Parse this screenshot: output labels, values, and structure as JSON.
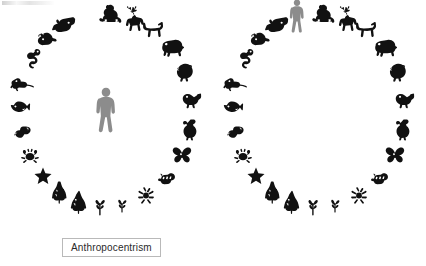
{
  "figure": {
    "background_color": "#ffffff",
    "silhouette_color": "#111111",
    "human_color": "#8c8c8c",
    "label_border_color": "#b9b9b9",
    "label_text_color": "#2a2a2a"
  },
  "panels": [
    {
      "id": "anthropocentrism",
      "label": "Anthropocentrism",
      "human_position": "center",
      "center_occupant": "human",
      "description": "Human figure stands alone at the centre of a ring of other organisms"
    },
    {
      "id": "ecocentrism",
      "label": "Ecocentrism",
      "human_position": "ring",
      "center_occupant": "none",
      "description": "Human figure takes its place within the ring of organisms; the centre is empty"
    }
  ],
  "ring_members": [
    {
      "index": 0,
      "name": "human",
      "icon": "human-icon",
      "angle_deg": 255,
      "tone": "gray"
    },
    {
      "index": 1,
      "name": "monkey",
      "icon": "monkey-icon",
      "angle_deg": 273,
      "tone": "black"
    },
    {
      "index": 2,
      "name": "deer",
      "icon": "deer-icon",
      "angle_deg": 288,
      "tone": "black"
    },
    {
      "index": 3,
      "name": "dog",
      "icon": "dog-icon",
      "angle_deg": 303,
      "tone": "black"
    },
    {
      "index": 4,
      "name": "boar",
      "icon": "boar-icon",
      "angle_deg": 320,
      "tone": "black"
    },
    {
      "index": 5,
      "name": "turkey",
      "icon": "turkey-icon",
      "angle_deg": 337,
      "tone": "black"
    },
    {
      "index": 6,
      "name": "bird",
      "icon": "bird-icon",
      "angle_deg": 354,
      "tone": "black"
    },
    {
      "index": 7,
      "name": "duck",
      "icon": "duck-icon",
      "angle_deg": 11,
      "tone": "black"
    },
    {
      "index": 8,
      "name": "butterfly",
      "icon": "butterfly-icon",
      "angle_deg": 28,
      "tone": "black"
    },
    {
      "index": 9,
      "name": "bee",
      "icon": "bee-icon",
      "angle_deg": 45,
      "tone": "black"
    },
    {
      "index": 10,
      "name": "spider",
      "icon": "spider-icon",
      "angle_deg": 62,
      "tone": "black"
    },
    {
      "index": 11,
      "name": "sprout",
      "icon": "sprout-icon",
      "angle_deg": 79,
      "tone": "black"
    },
    {
      "index": 12,
      "name": "seedling",
      "icon": "seedling-icon",
      "angle_deg": 94,
      "tone": "black"
    },
    {
      "index": 13,
      "name": "conifer",
      "icon": "conifer-icon",
      "angle_deg": 108,
      "tone": "black"
    },
    {
      "index": 14,
      "name": "shrub",
      "icon": "shrub-icon",
      "angle_deg": 122,
      "tone": "black"
    },
    {
      "index": 15,
      "name": "starfish",
      "icon": "starfish-icon",
      "angle_deg": 137,
      "tone": "black"
    },
    {
      "index": 16,
      "name": "crab",
      "icon": "crab-icon",
      "angle_deg": 152,
      "tone": "black"
    },
    {
      "index": 17,
      "name": "shrimp",
      "icon": "shrimp-icon",
      "angle_deg": 167,
      "tone": "black"
    },
    {
      "index": 18,
      "name": "fish",
      "icon": "fish-icon",
      "angle_deg": 182,
      "tone": "black"
    },
    {
      "index": 19,
      "name": "lizard",
      "icon": "lizard-icon",
      "angle_deg": 197,
      "tone": "black"
    },
    {
      "index": 20,
      "name": "snake",
      "icon": "snake-icon",
      "angle_deg": 212,
      "tone": "black"
    },
    {
      "index": 21,
      "name": "rodent",
      "icon": "rodent-icon",
      "angle_deg": 227,
      "tone": "black"
    },
    {
      "index": 22,
      "name": "dolphin",
      "icon": "dolphin-icon",
      "angle_deg": 241,
      "tone": "black"
    }
  ],
  "ring_geometry": {
    "center_x": 106,
    "center_y": 110,
    "radius_x": 86,
    "radius_y": 97
  }
}
